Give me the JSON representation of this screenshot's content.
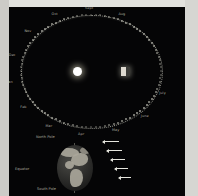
{
  "diagram": {
    "background_color": "#050506",
    "frame_color": "#d8d8d4"
  },
  "orbit": {
    "sun_label": "Sun",
    "earth_label": "Earth",
    "month_labels": [
      {
        "text": "Sept",
        "angle_deg": 90
      },
      {
        "text": "Oct",
        "angle_deg": 115
      },
      {
        "text": "Nov",
        "angle_deg": 140
      },
      {
        "text": "Dec",
        "angle_deg": 165
      },
      {
        "text": "Jan",
        "angle_deg": 190
      },
      {
        "text": "Feb",
        "angle_deg": 215
      },
      {
        "text": "Mar",
        "angle_deg": 240
      },
      {
        "text": "Apr",
        "angle_deg": 265
      },
      {
        "text": "May",
        "angle_deg": 290
      },
      {
        "text": "June",
        "angle_deg": 315
      },
      {
        "text": "July",
        "angle_deg": 340
      },
      {
        "text": "Aug",
        "angle_deg": 65
      }
    ]
  },
  "globe": {
    "north_pole_label": "North Pole",
    "equator_label": "Equator",
    "south_pole_label": "South Pole",
    "sunlight_rays_count": 5,
    "land_color": "#a9a69a",
    "ocean_color": "#2a2a28"
  }
}
